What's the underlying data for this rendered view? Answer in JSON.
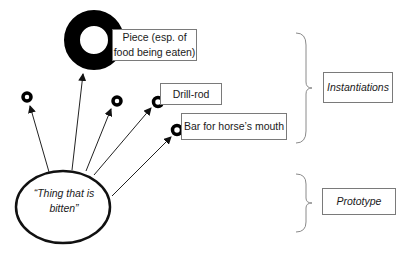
{
  "diagram": {
    "prototype_node": {
      "label_line1": "“Thing that is",
      "label_line2": "bitten”"
    },
    "instances": [
      {
        "label_line1": "Piece (esp. of",
        "label_line2": "food being eaten)"
      },
      {
        "label": "Drill-rod"
      },
      {
        "label": "Bar for horse’s mouth"
      }
    ],
    "groups": {
      "instantiations": "Instantiations",
      "prototype": "Prototype"
    },
    "colors": {
      "stroke": "#111111",
      "box_border": "#7a7a7a",
      "brace": "#8a8a8a"
    }
  }
}
